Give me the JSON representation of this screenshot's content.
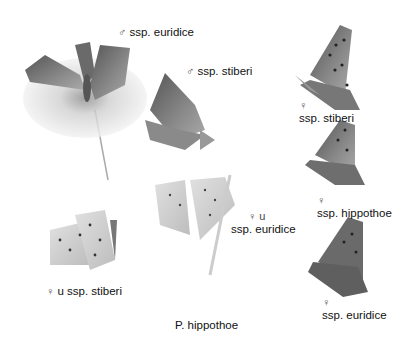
{
  "plate": {
    "title": "P. hippothoe",
    "labels": [
      {
        "id": "male-euridice",
        "symbol": "♂",
        "text": "ssp. euridice"
      },
      {
        "id": "male-stiberi",
        "symbol": "♂",
        "text": "ssp. stiberi"
      },
      {
        "id": "female-stiberi",
        "symbol": "♀",
        "text": "ssp. stiberi"
      },
      {
        "id": "female-hippothoe",
        "symbol": "♀",
        "text": "ssp. hippothoe"
      },
      {
        "id": "female-underside-euridice",
        "symbol": "♀ u",
        "text": "ssp. euridice"
      },
      {
        "id": "female-underside-stiberi",
        "symbol": "♀",
        "text": "u ssp. stiberi"
      },
      {
        "id": "female-euridice",
        "symbol": "♀",
        "text": "ssp. euridice"
      }
    ]
  }
}
